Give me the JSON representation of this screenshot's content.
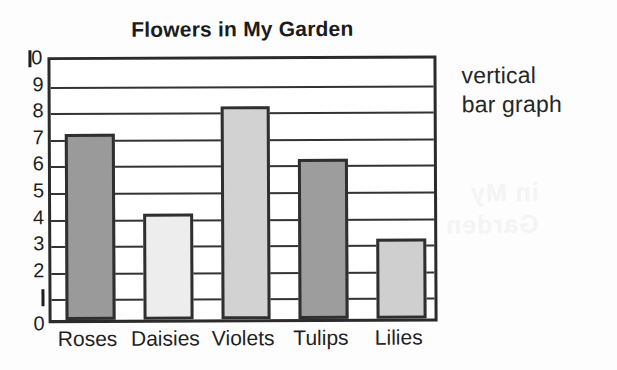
{
  "annotation": {
    "line1": "vertical",
    "line2": "bar graph"
  },
  "chart_data": {
    "type": "bar",
    "title": "Flowers in My Garden",
    "xlabel": "",
    "ylabel": "",
    "categories": [
      "Roses",
      "Daisies",
      "Violets",
      "Tulips",
      "Lilies"
    ],
    "values": [
      7,
      4,
      8,
      6,
      3
    ],
    "ylim": [
      0,
      10
    ],
    "ytick_labels": [
      "0",
      "1",
      "2",
      "3",
      "4",
      "5",
      "6",
      "7",
      "8",
      "9",
      "10"
    ],
    "ytick_values": [
      0,
      1,
      2,
      3,
      4,
      5,
      6,
      7,
      8,
      9,
      10
    ],
    "grid": true,
    "grid_axis": "y",
    "legend": false,
    "legend_position": "none",
    "orientation": "vertical",
    "bar_colors": [
      "#9a9a9a",
      "#ededed",
      "#d2d2d2",
      "#9d9d9d",
      "#cfcfcf"
    ],
    "bar_edge_color": "#2f2f2f",
    "frame_color": "#2b2b2b",
    "annotations": [
      "vertical bar graph"
    ]
  },
  "bleed_text": {
    "a": "Flowers",
    "b": "in My",
    "c": "Garden"
  }
}
